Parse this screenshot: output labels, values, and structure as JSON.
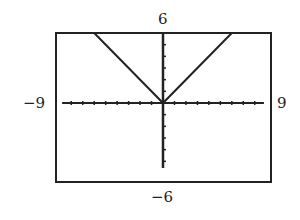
{
  "chart_data": {
    "type": "line",
    "title": "",
    "function": "y = |x|",
    "series": [
      {
        "name": "y=|x|",
        "x": [
          -6,
          0,
          6
        ],
        "y": [
          6,
          0,
          6
        ]
      }
    ],
    "xlim": [
      -9,
      9
    ],
    "ylim": [
      -6,
      6
    ],
    "xscale": 1,
    "yscale": 1,
    "tick_labels": {
      "top": "6",
      "bottom": "-6",
      "left": "-9",
      "right": "9"
    },
    "grid": false,
    "colors": {
      "frame": "#222222",
      "line": "#222222"
    }
  },
  "labels": {
    "ymax": "6",
    "ymin": "−6",
    "xmin": "−9",
    "xmax": "9"
  }
}
